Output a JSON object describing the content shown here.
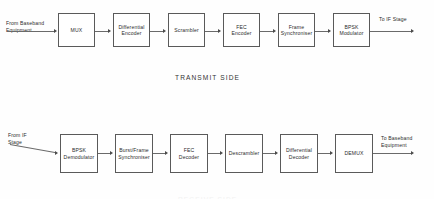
{
  "diagram": {
    "line_color": "#6a6a6a",
    "box_border_color": "#5a5a5a",
    "text_color": "#2b2b2b",
    "background": "#fefefe"
  },
  "transmit": {
    "caption": "TRANSMIT SIDE",
    "input_label_line1": "From Baseband",
    "input_label_line2": "Equipment",
    "output_label": "To IF Stage",
    "blocks": [
      {
        "line1": "MUX",
        "line2": ""
      },
      {
        "line1": "Differential",
        "line2": "Encoder"
      },
      {
        "line1": "Scrambler",
        "line2": ""
      },
      {
        "line1": "FEC",
        "line2": "Encoder"
      },
      {
        "line1": "Frame",
        "line2": "Synchroniser"
      },
      {
        "line1": "BPSK",
        "line2": "Modulator"
      }
    ]
  },
  "receive": {
    "caption": "RECEIVE SIDE",
    "input_label_line1": "From IF",
    "input_label_line2": "Stage",
    "output_label_line1": "To Baseband",
    "output_label_line2": "Equipment",
    "blocks": [
      {
        "line1": "BPSK",
        "line2": "Demodulator"
      },
      {
        "line1": "Burst/Frame",
        "line2": "Synchroniser"
      },
      {
        "line1": "FEC",
        "line2": "Decoder"
      },
      {
        "line1": "Descrambler",
        "line2": ""
      },
      {
        "line1": "Differential",
        "line2": "Decoder"
      },
      {
        "line1": "DEMUX",
        "line2": ""
      }
    ]
  }
}
